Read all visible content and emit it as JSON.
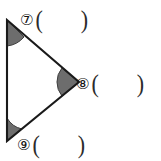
{
  "document": {
    "kind": "geometry-worksheet-figure",
    "background_color": "#ffffff",
    "ink_color": "#1a1a1a"
  },
  "figure": {
    "shape_name": "triangle",
    "stroke_color": "#1a1a1a",
    "fill_color": "none",
    "angle_marker_color": "#6b6b6b",
    "angle_marker_stroke": "#3a3a3a",
    "vertices": [
      {
        "name": "top-left-vertex",
        "x": 7,
        "y": 20
      },
      {
        "name": "right-apex-vertex",
        "x": 79,
        "y": 82
      },
      {
        "name": "bottom-left-vertex",
        "x": 7,
        "y": 141
      }
    ],
    "edges": [
      {
        "name": "left-edge",
        "from": "top-left-vertex",
        "to": "bottom-left-vertex"
      },
      {
        "name": "upper-right-edge",
        "from": "top-left-vertex",
        "to": "right-apex-vertex"
      },
      {
        "name": "lower-right-edge",
        "from": "right-apex-vertex",
        "to": "bottom-left-vertex"
      }
    ],
    "angle_markers": [
      {
        "name": "angle-marker-top",
        "at_vertex": "top-left-vertex",
        "shaded": true
      },
      {
        "name": "angle-marker-right",
        "at_vertex": "right-apex-vertex",
        "shaded": true
      },
      {
        "name": "angle-marker-bottom",
        "at_vertex": "bottom-left-vertex",
        "shaded": true
      }
    ]
  },
  "answers": {
    "rows": [
      {
        "id": "7",
        "marker": "⑦",
        "paren_open": "(",
        "paren_close": ")",
        "value": ""
      },
      {
        "id": "8",
        "marker": "⑧",
        "paren_open": "(",
        "paren_close": ")",
        "value": ""
      },
      {
        "id": "9",
        "marker": "⑨",
        "paren_open": "(",
        "paren_close": ")",
        "value": ""
      }
    ]
  }
}
